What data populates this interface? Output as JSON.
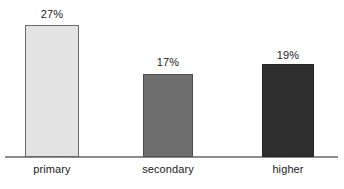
{
  "chart_data": {
    "type": "bar",
    "title": "",
    "subtitle": "",
    "xlabel": "",
    "ylabel": "",
    "categories": [
      "primary",
      "secondary",
      "higher"
    ],
    "values": [
      27,
      17,
      19
    ],
    "value_labels": [
      "27%",
      "17%",
      "19%"
    ],
    "ylim": [
      0,
      32
    ],
    "grid": false,
    "legend": null,
    "axis": {
      "baseline_visible": true,
      "y_axis_visible": false,
      "ticks_visible": false
    },
    "series": [
      {
        "name": "",
        "values": [
          27,
          17,
          19
        ]
      }
    ],
    "bar_colors": [
      "#e3e3e3",
      "#6e6e6e",
      "#2e2e2e"
    ],
    "bar_border_colors": [
      "#6a6a6a",
      "#4f4f4f",
      "#242424"
    ],
    "axis_color": "#8d8d8d",
    "text_color": "#1a1a1a",
    "background_color": "#ffffff"
  },
  "bars": [
    {
      "category": "primary",
      "value_label": "27%"
    },
    {
      "category": "secondary",
      "value_label": "17%"
    },
    {
      "category": "higher",
      "value_label": "19%"
    }
  ]
}
